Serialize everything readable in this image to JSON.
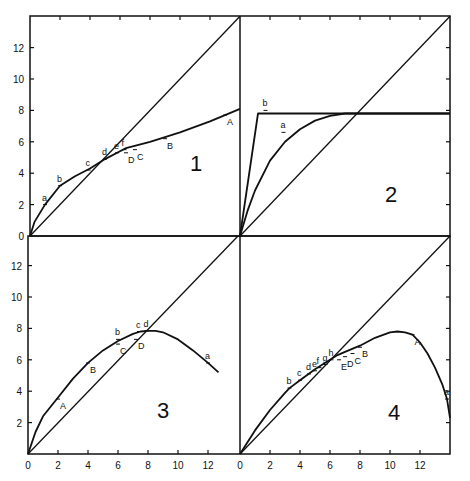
{
  "chart_data": [
    {
      "type": "line",
      "panel": "1",
      "title": "1",
      "xlim": [
        0,
        14
      ],
      "ylim": [
        0,
        14
      ],
      "y_ticks": [
        0,
        2,
        4,
        6,
        8,
        10,
        12
      ],
      "series": [
        {
          "name": "diagonal",
          "x": [
            0,
            14
          ],
          "y": [
            0,
            14
          ]
        },
        {
          "name": "curve",
          "x": [
            0,
            0.3,
            1,
            2,
            3,
            4,
            5,
            6,
            6.4,
            8,
            10,
            12,
            13,
            14
          ],
          "y": [
            0,
            0.9,
            2.0,
            3.2,
            3.8,
            4.3,
            4.9,
            5.4,
            5.6,
            6.0,
            6.6,
            7.3,
            7.7,
            8.1
          ]
        }
      ],
      "annotations": [
        {
          "text": "a",
          "x": 1.0,
          "y": 2.0
        },
        {
          "text": "b",
          "x": 2.0,
          "y": 3.2
        },
        {
          "text": "c",
          "x": 3.9,
          "y": 4.2
        },
        {
          "text": "d",
          "x": 5.0,
          "y": 4.9
        },
        {
          "text": "e",
          "x": 5.8,
          "y": 5.3
        },
        {
          "text": "f",
          "x": 6.3,
          "y": 5.5
        },
        {
          "text": "D",
          "x": 6.4,
          "y": 5.3
        },
        {
          "text": "C",
          "x": 7.0,
          "y": 5.5
        },
        {
          "text": "B",
          "x": 9.0,
          "y": 6.2
        },
        {
          "text": "A",
          "x": 13.0,
          "y": 7.7
        }
      ]
    },
    {
      "type": "line",
      "panel": "2",
      "title": "2",
      "xlim": [
        0,
        14
      ],
      "ylim": [
        0,
        14
      ],
      "series": [
        {
          "name": "diagonal",
          "x": [
            0,
            14
          ],
          "y": [
            0,
            14
          ]
        },
        {
          "name": "b",
          "x": [
            0,
            1.2,
            14
          ],
          "y": [
            0,
            7.8,
            7.8
          ]
        },
        {
          "name": "a",
          "x": [
            0,
            0.5,
            1,
            2,
            3,
            4,
            5,
            6,
            7,
            8,
            14
          ],
          "y": [
            0,
            1.6,
            2.9,
            4.8,
            6.0,
            6.8,
            7.35,
            7.65,
            7.8,
            7.8,
            7.8
          ]
        }
      ],
      "annotations": [
        {
          "text": "b",
          "x": 1.7,
          "y": 8.0
        },
        {
          "text": "a",
          "x": 2.9,
          "y": 6.6
        }
      ]
    },
    {
      "type": "line",
      "panel": "3",
      "title": "3",
      "xlim": [
        0,
        14
      ],
      "ylim": [
        0,
        14
      ],
      "x_ticks": [
        0,
        2,
        4,
        6,
        8,
        10,
        12
      ],
      "y_ticks": [
        2,
        4,
        6,
        8,
        10,
        12
      ],
      "series": [
        {
          "name": "diagonal",
          "x": [
            0,
            14
          ],
          "y": [
            0,
            14
          ]
        },
        {
          "name": "curve",
          "x": [
            0,
            0.5,
            1,
            2,
            3,
            4,
            5,
            6,
            7,
            7.5,
            8,
            8.5,
            9,
            10,
            11,
            12,
            12.7
          ],
          "y": [
            0,
            1.4,
            2.4,
            3.6,
            4.8,
            5.8,
            6.6,
            7.2,
            7.65,
            7.8,
            7.85,
            7.85,
            7.75,
            7.3,
            6.6,
            5.8,
            5.2
          ]
        }
      ],
      "annotations": [
        {
          "text": "A",
          "x": 2.0,
          "y": 3.5
        },
        {
          "text": "B",
          "x": 4.0,
          "y": 5.8
        },
        {
          "text": "b",
          "x": 6.0,
          "y": 7.3
        },
        {
          "text": "C",
          "x": 6.0,
          "y": 7.0
        },
        {
          "text": "c",
          "x": 7.4,
          "y": 7.8
        },
        {
          "text": "d",
          "x": 7.9,
          "y": 7.85
        },
        {
          "text": "D",
          "x": 7.2,
          "y": 7.3
        },
        {
          "text": "a",
          "x": 12.0,
          "y": 5.8
        }
      ]
    },
    {
      "type": "line",
      "panel": "4",
      "title": "4",
      "xlim": [
        0,
        14
      ],
      "ylim": [
        0,
        14
      ],
      "x_ticks": [
        0,
        2,
        4,
        6,
        8,
        10,
        12
      ],
      "series": [
        {
          "name": "diagonal",
          "x": [
            0,
            14
          ],
          "y": [
            0,
            14
          ]
        },
        {
          "name": "curve",
          "x": [
            0,
            1,
            2,
            3,
            3.3,
            4,
            5,
            6,
            6.5,
            7,
            8,
            9,
            10,
            10.5,
            11,
            11.5,
            12,
            12.5,
            13,
            13.5,
            13.8,
            14
          ],
          "y": [
            0,
            1.5,
            2.8,
            3.9,
            4.2,
            4.7,
            5.4,
            6.0,
            6.3,
            6.5,
            6.9,
            7.4,
            7.75,
            7.8,
            7.75,
            7.6,
            7.1,
            6.4,
            5.5,
            4.4,
            3.5,
            2.3
          ]
        }
      ],
      "annotations": [
        {
          "text": "b",
          "x": 3.3,
          "y": 4.2
        },
        {
          "text": "c",
          "x": 4.0,
          "y": 4.7
        },
        {
          "text": "d",
          "x": 4.6,
          "y": 5.1
        },
        {
          "text": "e",
          "x": 5.0,
          "y": 5.3
        },
        {
          "text": "f",
          "x": 5.3,
          "y": 5.5
        },
        {
          "text": "g",
          "x": 5.7,
          "y": 5.7
        },
        {
          "text": "h",
          "x": 6.1,
          "y": 6.0
        },
        {
          "text": "E",
          "x": 6.6,
          "y": 6.0
        },
        {
          "text": "D",
          "x": 7.0,
          "y": 6.2
        },
        {
          "text": "C",
          "x": 7.5,
          "y": 6.4
        },
        {
          "text": "B",
          "x": 8.0,
          "y": 6.8
        },
        {
          "text": "A",
          "x": 11.5,
          "y": 7.6
        },
        {
          "text": "a",
          "x": 13.8,
          "y": 3.5
        }
      ]
    }
  ],
  "labels": {
    "panel1": "1",
    "panel2": "2",
    "panel3": "3",
    "panel4": "4",
    "upper_y_ticks": [
      "0",
      "2",
      "4",
      "6",
      "8",
      "10",
      "12"
    ],
    "lower_y_ticks": [
      "2",
      "4",
      "6",
      "8",
      "10",
      "12"
    ],
    "x_ticks_left": [
      "0",
      "2",
      "4",
      "6",
      "8",
      "10",
      "12"
    ],
    "x_ticks_right": [
      "0",
      "2",
      "4",
      "6",
      "8",
      "10",
      "12"
    ]
  }
}
